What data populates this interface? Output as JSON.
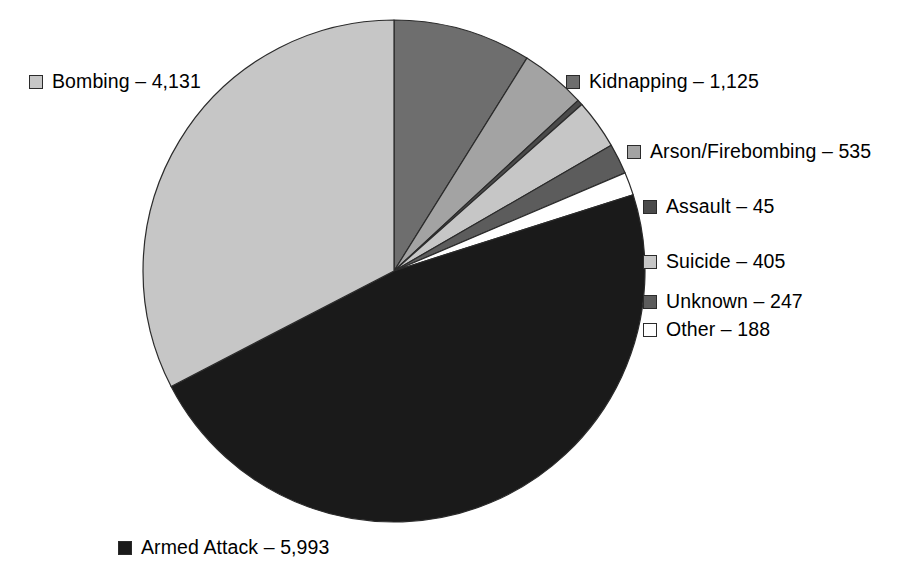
{
  "chart_data": {
    "type": "pie",
    "title": "",
    "subtitle": "",
    "xlabel": "",
    "ylabel": "",
    "legend_position": "around-slices",
    "grid": false,
    "total": 12669,
    "start_angle_deg": 0,
    "direction": "clockwise",
    "categories": [
      "Kidnapping",
      "Arson/Firebombing",
      "Assault",
      "Suicide",
      "Unknown",
      "Other",
      "Armed Attack",
      "Bombing"
    ],
    "values": [
      1125,
      535,
      45,
      405,
      247,
      188,
      5993,
      4131
    ],
    "slices": [
      {
        "label": "Kidnapping",
        "value": 1125,
        "value_text": "1,125",
        "color": "#6e6e6e",
        "stroke": "#2b2b2b"
      },
      {
        "label": "Arson/Firebombing",
        "value": 535,
        "value_text": "535",
        "color": "#a3a3a3",
        "stroke": "#2b2b2b"
      },
      {
        "label": "Assault",
        "value": 45,
        "value_text": "45",
        "color": "#4a4a4a",
        "stroke": "#2b2b2b"
      },
      {
        "label": "Suicide",
        "value": 405,
        "value_text": "405",
        "color": "#c6c6c6",
        "stroke": "#2b2b2b"
      },
      {
        "label": "Unknown",
        "value": 247,
        "value_text": "247",
        "color": "#5c5c5c",
        "stroke": "#2b2b2b"
      },
      {
        "label": "Other",
        "value": 188,
        "value_text": "188",
        "color": "#ffffff",
        "stroke": "#2b2b2b"
      },
      {
        "label": "Armed Attack",
        "value": 5993,
        "value_text": "5,993",
        "color": "#1a1a1a",
        "stroke": "#2b2b2b"
      },
      {
        "label": "Bombing",
        "value": 4131,
        "value_text": "4,131",
        "color": "#c6c6c6",
        "stroke": "#2b2b2b"
      }
    ]
  },
  "legend": {
    "separator": "–",
    "items": [
      {
        "key": "bombing",
        "label": "Bombing",
        "value_text": "4,131",
        "text": "Bombing – 4,131",
        "swatch_color": "#c6c6c6"
      },
      {
        "key": "kidnapping",
        "label": "Kidnapping",
        "value_text": "1,125",
        "text": "Kidnapping – 1,125",
        "swatch_color": "#6e6e6e"
      },
      {
        "key": "arson",
        "label": "Arson/Firebombing",
        "value_text": "535",
        "text": "Arson/Firebombing – 535",
        "swatch_color": "#a3a3a3"
      },
      {
        "key": "assault",
        "label": "Assault",
        "value_text": "45",
        "text": "Assault – 45",
        "swatch_color": "#4a4a4a"
      },
      {
        "key": "suicide",
        "label": "Suicide",
        "value_text": "405",
        "text": "Suicide – 405",
        "swatch_color": "#c6c6c6"
      },
      {
        "key": "unknown",
        "label": "Unknown",
        "value_text": "247",
        "text": "Unknown – 247",
        "swatch_color": "#5c5c5c"
      },
      {
        "key": "other",
        "label": "Other",
        "value_text": "188",
        "text": "Other – 188",
        "swatch_color": "#ffffff"
      },
      {
        "key": "armed",
        "label": "Armed Attack",
        "value_text": "5,993",
        "text": "Armed Attack – 5,993",
        "swatch_color": "#1a1a1a"
      }
    ]
  }
}
